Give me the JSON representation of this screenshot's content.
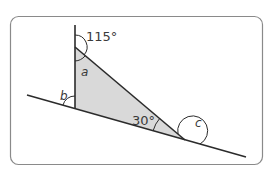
{
  "diagram": {
    "type": "geometry-triangle-angles",
    "colors": {
      "frame": "#8a8a8a",
      "line": "#2b2b2b",
      "fill": "#d9d9d9",
      "text": "#3a3a3a"
    },
    "labels": {
      "exterior_top": "115°",
      "angle_a": "a",
      "angle_b": "b",
      "angle_30": "30°",
      "angle_c": "c"
    }
  }
}
